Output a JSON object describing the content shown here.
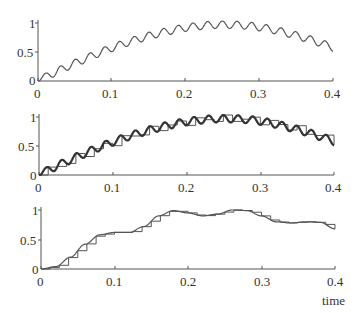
{
  "chart_data": [
    {
      "type": "line",
      "panel": "top",
      "title": "",
      "xlabel": "",
      "ylabel": "",
      "xlim": [
        0,
        0.4
      ],
      "ylim": [
        0,
        1
      ],
      "xticks": [
        "0",
        "0.1",
        "0.2",
        "0.3",
        "0.4"
      ],
      "yticks": [
        "0",
        "0.5",
        "1"
      ],
      "series": [
        {
          "name": "signal",
          "style": "thin-line",
          "x": [
            0,
            0.02,
            0.04,
            0.06,
            0.08,
            0.1,
            0.12,
            0.14,
            0.16,
            0.18,
            0.2,
            0.22,
            0.24,
            0.26,
            0.28,
            0.3,
            0.32,
            0.34,
            0.36,
            0.38,
            0.4
          ],
          "values": [
            0,
            0.13,
            0.25,
            0.36,
            0.47,
            0.57,
            0.66,
            0.74,
            0.81,
            0.87,
            0.92,
            0.95,
            0.97,
            0.97,
            0.96,
            0.93,
            0.88,
            0.82,
            0.75,
            0.67,
            0.58
          ]
        }
      ],
      "grid": false
    },
    {
      "type": "line",
      "panel": "middle",
      "xlim": [
        0,
        0.4
      ],
      "ylim": [
        0,
        1
      ],
      "xticks": [
        "0",
        "0.1",
        "0.2",
        "0.3",
        "0.4"
      ],
      "yticks": [
        "0",
        "0.5",
        "1"
      ],
      "series": [
        {
          "name": "signal",
          "style": "bold-line",
          "note": "same signal as top panel"
        },
        {
          "name": "sample-and-hold",
          "style": "staircase",
          "sample_period": 0.0125
        }
      ],
      "grid": false
    },
    {
      "type": "line",
      "panel": "bottom",
      "xlabel": "time",
      "xlim": [
        0,
        0.4
      ],
      "ylim": [
        0,
        1
      ],
      "xticks": [
        "0",
        "0.1",
        "0.2",
        "0.3",
        "0.4"
      ],
      "yticks": [
        "0",
        "0.5",
        "1"
      ],
      "series": [
        {
          "name": "smoothed",
          "style": "thin-line",
          "x": [
            0,
            0.02,
            0.04,
            0.06,
            0.08,
            0.1,
            0.12,
            0.14,
            0.16,
            0.18,
            0.2,
            0.22,
            0.24,
            0.26,
            0.28,
            0.3,
            0.32,
            0.34,
            0.36,
            0.38,
            0.4
          ],
          "values": [
            0,
            0.04,
            0.2,
            0.42,
            0.58,
            0.62,
            0.62,
            0.72,
            0.9,
            0.99,
            0.95,
            0.9,
            0.93,
            1.0,
            0.99,
            0.9,
            0.8,
            0.78,
            0.8,
            0.79,
            0.68
          ]
        },
        {
          "name": "sample-and-hold",
          "style": "staircase",
          "sample_period": 0.0125
        }
      ],
      "grid": false
    }
  ],
  "labels": {
    "ytick_1": "1",
    "ytick_05": "0.5",
    "ytick_0": "0",
    "xticks": [
      "0",
      "0.1",
      "0.2",
      "0.3",
      "0.4"
    ],
    "xlabel": "time"
  },
  "ripple": {
    "period": 0.02,
    "amplitude": 0.065
  }
}
